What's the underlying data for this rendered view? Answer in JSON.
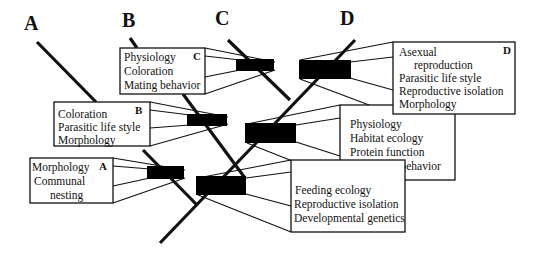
{
  "diagram": {
    "type": "phylogenetic-tree-with-character-boxes",
    "lineage_labels": [
      {
        "id": "A",
        "text": "A"
      },
      {
        "id": "B",
        "text": "B"
      },
      {
        "id": "C",
        "text": "C"
      },
      {
        "id": "D",
        "text": "D"
      }
    ],
    "boxes": [
      {
        "id": "box-C",
        "tag": "C",
        "lines": [
          "Physiology",
          "Coloration",
          "Mating behavior"
        ]
      },
      {
        "id": "box-B",
        "tag": "B",
        "lines": [
          "Coloration",
          "Parasitic life style",
          "Morphology"
        ]
      },
      {
        "id": "box-A",
        "tag": "A",
        "lines": [
          "Morphology",
          "Communal",
          "nesting"
        ]
      },
      {
        "id": "box-D",
        "tag": "D",
        "lines": [
          "Asexual",
          "reproduction",
          "Parasitic life style",
          "Reproductive isolation",
          "Morphology"
        ]
      },
      {
        "id": "box-internal-upper",
        "tag": "",
        "lines": [
          "Physiology",
          "Habitat ecology",
          "Protein function",
          "Migratory behavior"
        ]
      },
      {
        "id": "box-internal-lower",
        "tag": "",
        "lines": [
          "Feeding ecology",
          "Reproductive isolation",
          "Developmental genetics"
        ]
      }
    ],
    "colors": {
      "ink": "#111111",
      "bar": "#000000",
      "background": "#ffffff"
    }
  }
}
